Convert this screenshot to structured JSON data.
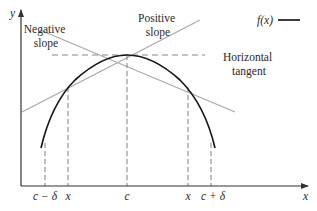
{
  "diagram": {
    "axes": {
      "x_label": "x",
      "y_label": "y"
    },
    "legend": {
      "label": "f(x)"
    },
    "annotations": {
      "negative_slope": [
        "Negative",
        "slope"
      ],
      "positive_slope": [
        "Positive",
        "slope"
      ],
      "horizontal_tangent": [
        "Horizontal",
        "tangent"
      ]
    },
    "x_ticks": [
      "c − δ",
      "x",
      "c",
      "x",
      "c + δ"
    ],
    "colors": {
      "curve": "#1a1a1a",
      "tangent": "#aaaaaa",
      "dashed": "#8a8a8a",
      "axis": "#333333",
      "text": "#2a2a2a"
    }
  }
}
